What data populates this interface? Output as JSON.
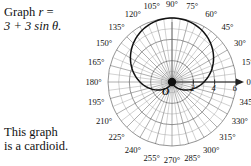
{
  "figure": {
    "prompt": {
      "line1_prefix": "Graph ",
      "line1_var": "r",
      "line1_eq": " =",
      "line2": "3 + 3 sin θ."
    },
    "conclusion": {
      "line1": "This graph",
      "line2": "is a cardioid."
    }
  },
  "chart_data": {
    "type": "line",
    "coordinate_system": "polar",
    "title": "",
    "equation": "r = 3 + 3 sin θ",
    "curve_name": "cardioid",
    "pole_label": "O",
    "angle_unit": "degrees",
    "angle_tick_step": 15,
    "angle_labels": [
      "0°",
      "15°",
      "30°",
      "45°",
      "60°",
      "75°",
      "90°",
      "105°",
      "120°",
      "135°",
      "150°",
      "165°",
      "180°",
      "195°",
      "210°",
      "225°",
      "240°",
      "255°",
      "270°",
      "285°",
      "300°",
      "315°",
      "330°",
      "345°"
    ],
    "radial_ticks": [
      2,
      4,
      6
    ],
    "radial_tick_labels": [
      "2",
      "4",
      "6"
    ],
    "rlim": [
      0,
      6
    ],
    "grid": true,
    "legend": "none",
    "polar_axis_arrow": true,
    "series": [
      {
        "name": "r = 3 + 3 sin θ",
        "theta_deg": [
          0,
          15,
          30,
          45,
          60,
          75,
          90,
          105,
          120,
          135,
          150,
          165,
          180,
          195,
          210,
          225,
          240,
          255,
          270,
          285,
          300,
          315,
          330,
          345,
          360
        ],
        "r": [
          3.0,
          3.78,
          4.5,
          5.12,
          5.6,
          5.9,
          6.0,
          5.9,
          5.6,
          5.12,
          4.5,
          3.78,
          3.0,
          2.22,
          1.5,
          0.88,
          0.4,
          0.1,
          0.0,
          0.1,
          0.4,
          0.88,
          1.5,
          2.22,
          3.0
        ]
      }
    ]
  }
}
